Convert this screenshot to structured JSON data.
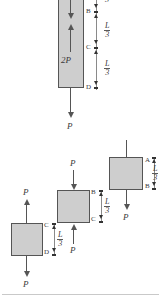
{
  "figure": {
    "bar_fill_color": "#cecece",
    "line_color": "#555555",
    "text_color": "#3a3a3a",
    "length_label": {
      "numerator": "L",
      "denominator": "3"
    },
    "forces": {
      "p": "P",
      "two_p": "2P"
    }
  },
  "main_bar": {
    "internal_label": "2P",
    "nodes": [
      {
        "id": "B",
        "label": "B"
      },
      {
        "id": "C",
        "label": "C"
      },
      {
        "id": "D",
        "label": "D"
      }
    ],
    "dimensions": [
      {
        "numerator": "L",
        "denominator": "3"
      },
      {
        "numerator": "L",
        "denominator": "3"
      }
    ],
    "partial_top_dimension_denominator": "3",
    "bottom_force": "P",
    "top_internal_arrow": "down",
    "lower_internal_arrow": "up"
  },
  "fbd_segments": [
    {
      "name": "segment-AB",
      "top_node": "A",
      "bottom_node": "B",
      "dimension": {
        "numerator": "L",
        "denominator": "3"
      },
      "bottom_force": "P",
      "bottom_force_direction": "down",
      "has_top_stem": true
    },
    {
      "name": "segment-BC",
      "top_node": "B",
      "bottom_node": "C",
      "dimension": {
        "numerator": "L",
        "denominator": "3"
      },
      "top_force": "P",
      "top_force_direction": "down",
      "bottom_force": "P",
      "bottom_force_direction": "up"
    },
    {
      "name": "segment-CD",
      "top_node": "C",
      "bottom_node": "D",
      "dimension": {
        "numerator": "L",
        "denominator": "3"
      },
      "top_force": "P",
      "top_force_direction": "up",
      "bottom_force": "P",
      "bottom_force_direction": "down"
    }
  ]
}
